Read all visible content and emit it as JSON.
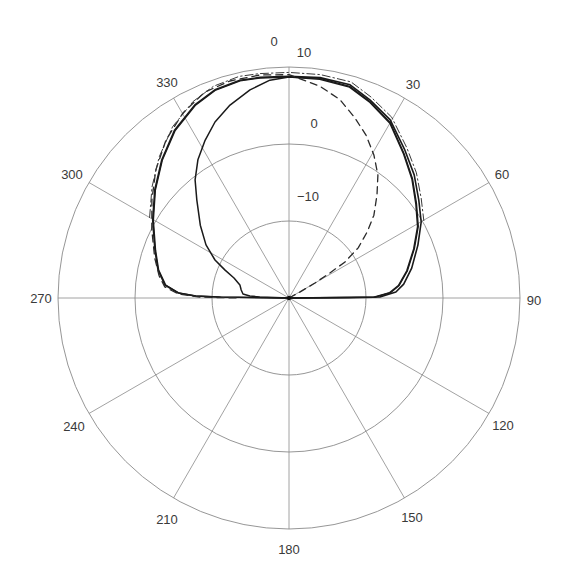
{
  "chart_data": {
    "type": "polar-line",
    "title": "",
    "angle_unit": "degrees",
    "angle_direction": "clockwise",
    "angle_zero": "top",
    "angle_ticks": [
      0,
      30,
      60,
      90,
      120,
      150,
      180,
      210,
      240,
      270,
      300,
      330
    ],
    "angle_tick_labels": [
      "0",
      "30",
      "60",
      "90",
      "120",
      "150",
      "180",
      "210",
      "240",
      "270",
      "300",
      "330"
    ],
    "radial_unit": "dB",
    "radial_range": [
      -20,
      10
    ],
    "radial_ticks": [
      -10,
      0,
      10
    ],
    "radial_tick_labels": [
      "−10",
      "0",
      "10"
    ],
    "grid": true,
    "legend": null,
    "series": [
      {
        "name": "outer-solid",
        "style": "solid",
        "color": "#1a1a1a",
        "width": 1.6,
        "points": [
          [
            90,
            -20
          ],
          [
            89.4,
            -8.2
          ],
          [
            86.8,
            -6.1
          ],
          [
            83.1,
            -5.0
          ],
          [
            76.3,
            -3.6
          ],
          [
            67.7,
            -1.9
          ],
          [
            60.1,
            -0.2
          ],
          [
            53.0,
            1.1
          ],
          [
            45.5,
            2.8
          ],
          [
            38.1,
            4.4
          ],
          [
            29.6,
            6.6
          ],
          [
            22.2,
            7.8
          ],
          [
            16.0,
            8.8
          ],
          [
            8.0,
            8.9
          ],
          [
            0,
            8.8
          ],
          [
            352.5,
            8.9
          ],
          [
            347.3,
            9.0
          ],
          [
            340.4,
            8.7
          ],
          [
            334.0,
            7.9
          ],
          [
            325.8,
            6.4
          ],
          [
            317.4,
            4.4
          ],
          [
            308.9,
            2.4
          ],
          [
            299.8,
            0.4
          ],
          [
            289.7,
            -1.5
          ],
          [
            282.1,
            -2.6
          ],
          [
            276.0,
            -3.8
          ],
          [
            272.6,
            -5.6
          ],
          [
            271.2,
            -7.8
          ],
          [
            270.8,
            -11.0
          ],
          [
            270,
            -20
          ]
        ]
      },
      {
        "name": "outer-solid-2",
        "style": "solid",
        "color": "#1a1a1a",
        "width": 1.3,
        "points": [
          [
            90,
            -20
          ],
          [
            89.5,
            -8.8
          ],
          [
            87.0,
            -6.8
          ],
          [
            83.5,
            -5.6
          ],
          [
            77.0,
            -4.2
          ],
          [
            68.5,
            -2.5
          ],
          [
            61.0,
            -0.8
          ],
          [
            53.5,
            0.6
          ],
          [
            46.0,
            2.3
          ],
          [
            38.5,
            4.0
          ],
          [
            30.0,
            6.3
          ],
          [
            22.5,
            7.6
          ],
          [
            16.0,
            8.6
          ],
          [
            8.0,
            8.8
          ],
          [
            0,
            8.7
          ],
          [
            352.5,
            8.8
          ],
          [
            347.3,
            8.9
          ],
          [
            340.4,
            8.6
          ],
          [
            334.0,
            7.8
          ],
          [
            325.8,
            6.3
          ],
          [
            317.4,
            4.3
          ],
          [
            308.9,
            2.3
          ],
          [
            299.8,
            0.3
          ],
          [
            289.7,
            -1.6
          ],
          [
            282.1,
            -2.7
          ],
          [
            276.0,
            -3.9
          ],
          [
            272.6,
            -5.7
          ],
          [
            271.2,
            -7.9
          ],
          [
            270.8,
            -11.2
          ],
          [
            270,
            -20
          ]
        ]
      },
      {
        "name": "inner-solid",
        "style": "solid",
        "color": "#1a1a1a",
        "width": 1.5,
        "points": [
          [
            270,
            -20
          ],
          [
            272.0,
            -16.2
          ],
          [
            272.9,
            -14.9
          ],
          [
            275.0,
            -14.0
          ],
          [
            279.5,
            -13.7
          ],
          [
            284.9,
            -13.4
          ],
          [
            290.0,
            -12.4
          ],
          [
            293.6,
            -10.9
          ],
          [
            297.2,
            -9.2
          ],
          [
            302.6,
            -7.2
          ],
          [
            309.4,
            -5.1
          ],
          [
            316.8,
            -2.5
          ],
          [
            321.5,
            -0.4
          ],
          [
            326.6,
            1.5
          ],
          [
            332.0,
            3.2
          ],
          [
            337.2,
            4.8
          ],
          [
            343.0,
            6.2
          ],
          [
            349.4,
            7.5
          ],
          [
            355.0,
            8.4
          ],
          [
            0,
            8.7
          ],
          [
            8.0,
            8.7
          ],
          [
            16.0,
            8.5
          ],
          [
            22.5,
            7.5
          ],
          [
            30.0,
            6.2
          ],
          [
            38.5,
            3.9
          ],
          [
            46.0,
            2.2
          ],
          [
            53.5,
            0.5
          ],
          [
            61.0,
            -0.9
          ],
          [
            68.5,
            -2.6
          ],
          [
            77.0,
            -4.3
          ],
          [
            83.5,
            -5.7
          ],
          [
            87.0,
            -6.9
          ],
          [
            89.5,
            -9.0
          ],
          [
            89.8,
            -12.0
          ],
          [
            90,
            -20
          ]
        ]
      },
      {
        "name": "dashed",
        "style": "dashed",
        "color": "#2a2a2a",
        "width": 1.3,
        "points": [
          [
            61.4,
            -20
          ],
          [
            61.4,
            -18.4
          ],
          [
            60.0,
            -16.1
          ],
          [
            58.6,
            -13.8
          ],
          [
            57.3,
            -11.4
          ],
          [
            54.1,
            -8.9
          ],
          [
            49.8,
            -6.7
          ],
          [
            45.7,
            -4.6
          ],
          [
            40.5,
            -2.4
          ],
          [
            35.9,
            -0.3
          ],
          [
            30.7,
            1.6
          ],
          [
            25.3,
            3.4
          ],
          [
            20.1,
            4.9
          ],
          [
            14.4,
            6.6
          ],
          [
            8.3,
            7.8
          ],
          [
            2.9,
            8.5
          ],
          [
            0,
            9.0
          ],
          [
            352.6,
            9.2
          ],
          [
            344.8,
            9.2
          ],
          [
            337.8,
            8.9
          ],
          [
            330.2,
            7.7
          ],
          [
            322.1,
            6.0
          ],
          [
            313.9,
            4.0
          ],
          [
            305.6,
            1.9
          ],
          [
            296.4,
            -0.1
          ],
          [
            286.6,
            -1.8
          ],
          [
            279.6,
            -2.9
          ],
          [
            275.1,
            -3.8
          ],
          [
            272.1,
            -5.6
          ],
          [
            270.6,
            -8.4
          ],
          [
            270,
            -13.6
          ]
        ]
      },
      {
        "name": "dash-dot",
        "style": "dashdot",
        "color": "#3a3a3a",
        "width": 1.0,
        "points": [
          [
            300.0,
            0.9
          ],
          [
            309.0,
            2.9
          ],
          [
            317.4,
            4.9
          ],
          [
            325.8,
            6.9
          ],
          [
            334.0,
            8.4
          ],
          [
            340.4,
            9.2
          ],
          [
            347.3,
            9.5
          ],
          [
            352.5,
            9.4
          ],
          [
            0,
            9.3
          ],
          [
            8.0,
            9.3
          ],
          [
            16.0,
            9.2
          ],
          [
            22.2,
            8.2
          ],
          [
            29.6,
            7.0
          ],
          [
            38.1,
            4.8
          ],
          [
            45.5,
            3.2
          ],
          [
            53.0,
            1.5
          ],
          [
            60.1,
            0.2
          ]
        ]
      }
    ]
  },
  "layout": {
    "center_x": 289,
    "center_y": 298,
    "outer_radius": 231
  },
  "labels": {
    "angle": [
      {
        "text": "0",
        "x": 274,
        "y": 46
      },
      {
        "text": "30",
        "x": 413,
        "y": 89
      },
      {
        "text": "60",
        "x": 502,
        "y": 179
      },
      {
        "text": "90",
        "x": 534,
        "y": 305
      },
      {
        "text": "120",
        "x": 503,
        "y": 430
      },
      {
        "text": "150",
        "x": 412,
        "y": 522
      },
      {
        "text": "180",
        "x": 289,
        "y": 554
      },
      {
        "text": "210",
        "x": 167,
        "y": 524
      },
      {
        "text": "240",
        "x": 74,
        "y": 431
      },
      {
        "text": "270",
        "x": 41,
        "y": 303
      },
      {
        "text": "300",
        "x": 72,
        "y": 179
      },
      {
        "text": "330",
        "x": 167,
        "y": 87
      }
    ],
    "db": [
      {
        "text": "10",
        "x": 304,
        "y": 57
      },
      {
        "text": "0",
        "x": 314,
        "y": 128
      },
      {
        "text": "−10",
        "x": 308,
        "y": 201
      }
    ]
  }
}
